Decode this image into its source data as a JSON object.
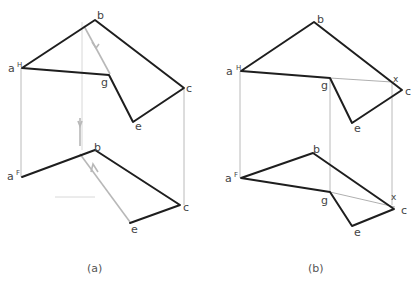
{
  "figure_a": {
    "caption": "(a)",
    "top_view": {
      "labels": {
        "a": "a",
        "a_sup": "H",
        "b": "b",
        "g": "g",
        "c": "c",
        "e": "e"
      }
    },
    "front_view": {
      "labels": {
        "a": "a",
        "a_sup": "F",
        "b": "b",
        "c": "c",
        "e": "e"
      }
    }
  },
  "figure_b": {
    "caption": "(b)",
    "top_view": {
      "labels": {
        "a": "a",
        "a_sup": "H",
        "b": "b",
        "g": "g",
        "x": "x",
        "c": "c",
        "e": "e"
      }
    },
    "front_view": {
      "labels": {
        "a": "a",
        "a_sup": "F",
        "b": "b",
        "g": "g",
        "x": "x",
        "c": "c",
        "e": "e"
      }
    }
  },
  "colors": {
    "edge": "#1e1e1e",
    "projection_line": "#a8a8a8",
    "sight_arrow": "#b8b8b8"
  }
}
